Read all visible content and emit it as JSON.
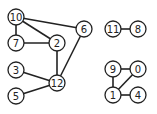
{
  "graph": {
    "nodes": [
      {
        "id": "10",
        "label": "10",
        "x": 16,
        "y": 17
      },
      {
        "id": "7",
        "label": "7",
        "x": 16,
        "y": 43
      },
      {
        "id": "2",
        "label": "2",
        "x": 57,
        "y": 43
      },
      {
        "id": "6",
        "label": "6",
        "x": 84,
        "y": 29
      },
      {
        "id": "3",
        "label": "3",
        "x": 16,
        "y": 70
      },
      {
        "id": "12",
        "label": "12",
        "x": 57,
        "y": 83
      },
      {
        "id": "5",
        "label": "5",
        "x": 16,
        "y": 96
      },
      {
        "id": "11",
        "label": "11",
        "x": 113,
        "y": 29
      },
      {
        "id": "8",
        "label": "8",
        "x": 138,
        "y": 29
      },
      {
        "id": "9",
        "label": "9",
        "x": 113,
        "y": 69
      },
      {
        "id": "0",
        "label": "0",
        "x": 138,
        "y": 69
      },
      {
        "id": "1",
        "label": "1",
        "x": 113,
        "y": 95
      },
      {
        "id": "4",
        "label": "4",
        "x": 138,
        "y": 95
      }
    ],
    "edges": [
      [
        "10",
        "7"
      ],
      [
        "10",
        "2"
      ],
      [
        "10",
        "6"
      ],
      [
        "7",
        "2"
      ],
      [
        "2",
        "12"
      ],
      [
        "6",
        "12"
      ],
      [
        "3",
        "12"
      ],
      [
        "5",
        "12"
      ],
      [
        "11",
        "8"
      ],
      [
        "9",
        "0"
      ],
      [
        "9",
        "1"
      ],
      [
        "1",
        "0"
      ],
      [
        "1",
        "4"
      ]
    ],
    "node_radius": 8
  }
}
